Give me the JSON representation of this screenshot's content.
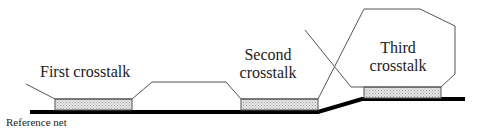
{
  "diagram": {
    "labels": {
      "first": "First crosstalk",
      "second_line1": "Second",
      "second_line2": "crosstalk",
      "third_line1": "Third",
      "third_line2": "crosstalk",
      "reference": "Reference net"
    },
    "colors": {
      "reference_net": "#000000",
      "victim_fill": "#d9d9d9",
      "outline": "#555555",
      "text": "#222222"
    },
    "elements": [
      {
        "id": "reference-net",
        "type": "thick-line",
        "meaning": "ground/reference net, steps up before third region"
      },
      {
        "id": "victim-segment-1",
        "type": "hatched-rectangle",
        "region": "First crosstalk"
      },
      {
        "id": "victim-segment-2",
        "type": "hatched-rectangle",
        "region": "Second crosstalk"
      },
      {
        "id": "victim-segment-3",
        "type": "hatched-rectangle",
        "region": "Third crosstalk"
      },
      {
        "id": "aggressor-path",
        "type": "outline",
        "meaning": "aggressor net route"
      }
    ]
  }
}
